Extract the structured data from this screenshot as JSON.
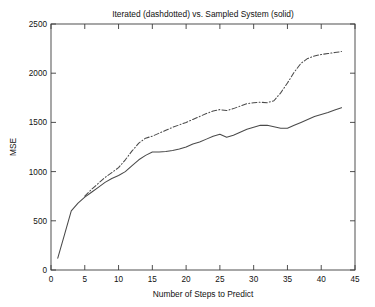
{
  "chart_data": {
    "type": "line",
    "title": "Iterated (dashdotted) vs. Sampled System (solid)",
    "xlabel": "Number of Steps to Predict",
    "ylabel": "MSE",
    "xlim": [
      0,
      45
    ],
    "ylim": [
      0,
      2500
    ],
    "xticks": [
      0,
      5,
      10,
      15,
      20,
      25,
      30,
      35,
      40,
      45
    ],
    "yticks": [
      0,
      500,
      1000,
      1500,
      2000,
      2500
    ],
    "xtick_labels": [
      "0",
      "5",
      "10",
      "15",
      "20",
      "25",
      "30",
      "35",
      "40",
      "45"
    ],
    "ytick_labels": [
      "0",
      "500",
      "1000",
      "1500",
      "2000",
      "2500"
    ],
    "grid": false,
    "legend": "none",
    "legend_note": "line style encodes series: dashdotted = Iterated, solid = Sampled System",
    "series": [
      {
        "name": "Sampled System (solid)",
        "style": "solid",
        "color": "#4a4a4a",
        "x": [
          1,
          2,
          3,
          4,
          5,
          6,
          7,
          8,
          9,
          10,
          11,
          12,
          13,
          14,
          15,
          16,
          17,
          18,
          19,
          20,
          21,
          22,
          23,
          24,
          25,
          26,
          27,
          28,
          29,
          30,
          31,
          32,
          33,
          34,
          35,
          36,
          37,
          38,
          39,
          40,
          41,
          42,
          43
        ],
        "values": [
          120,
          360,
          600,
          680,
          740,
          790,
          840,
          890,
          930,
          960,
          1000,
          1060,
          1120,
          1165,
          1200,
          1200,
          1205,
          1215,
          1230,
          1250,
          1280,
          1300,
          1330,
          1360,
          1380,
          1350,
          1370,
          1400,
          1430,
          1450,
          1470,
          1470,
          1455,
          1440,
          1440,
          1470,
          1500,
          1530,
          1560,
          1580,
          1600,
          1625,
          1650
        ]
      },
      {
        "name": "Iterated (dashdotted)",
        "style": "dashdot",
        "color": "#4a4a4a",
        "x": [
          5,
          6,
          7,
          8,
          9,
          10,
          11,
          12,
          13,
          14,
          15,
          16,
          17,
          18,
          19,
          20,
          21,
          22,
          23,
          24,
          25,
          26,
          27,
          28,
          29,
          30,
          31,
          32,
          33,
          34,
          35,
          36,
          37,
          38,
          39,
          40,
          41,
          42,
          43
        ],
        "values": [
          750,
          820,
          880,
          940,
          990,
          1040,
          1120,
          1210,
          1290,
          1340,
          1360,
          1390,
          1420,
          1450,
          1475,
          1500,
          1530,
          1560,
          1590,
          1615,
          1630,
          1620,
          1640,
          1665,
          1690,
          1700,
          1705,
          1700,
          1720,
          1800,
          1900,
          2010,
          2100,
          2150,
          2175,
          2190,
          2200,
          2210,
          2220
        ]
      }
    ]
  }
}
